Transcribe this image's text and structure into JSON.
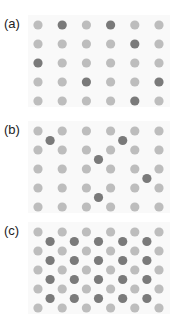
{
  "figure": {
    "colors": {
      "lattice_atom": "#bdbdbd",
      "defect_atom": "#7a7a7a",
      "background": "#ffffff"
    },
    "lattice": {
      "columns": 6,
      "rows": 5
    },
    "panels": [
      {
        "label": "(a)",
        "description": "substitutional impurities",
        "substitutions": [
          [
            0,
            1
          ],
          [
            0,
            3
          ],
          [
            1,
            4
          ],
          [
            2,
            0
          ],
          [
            3,
            2
          ],
          [
            3,
            5
          ],
          [
            4,
            4
          ]
        ],
        "interstitials": []
      },
      {
        "label": "(b)",
        "description": "interstitial impurities",
        "substitutions": [],
        "interstitials": [
          [
            0,
            0
          ],
          [
            0,
            3
          ],
          [
            1,
            2
          ],
          [
            2,
            4
          ],
          [
            3,
            2
          ]
        ]
      },
      {
        "label": "(c)",
        "description": "fully occupied interstitial sublattice",
        "substitutions": [],
        "interstitials": "all"
      }
    ]
  }
}
